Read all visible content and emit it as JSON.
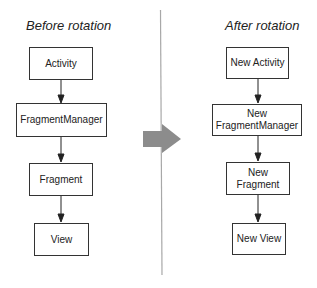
{
  "diagram": {
    "left_panel": {
      "title": "Before rotation",
      "nodes": [
        {
          "id": "activity",
          "label": "Activity"
        },
        {
          "id": "fragment-manager",
          "label": "FragmentManager"
        },
        {
          "id": "fragment",
          "label": "Fragment"
        },
        {
          "id": "view",
          "label": "View"
        }
      ]
    },
    "right_panel": {
      "title": "After rotation",
      "nodes": [
        {
          "id": "new-activity",
          "label": "New Activity"
        },
        {
          "id": "new-fragment-manager",
          "label": "New\nFragmentManager"
        },
        {
          "id": "new-fragment",
          "label": "New\nFragment"
        },
        {
          "id": "new-view",
          "label": "New View"
        }
      ]
    },
    "edges": [
      {
        "from": "activity",
        "to": "fragment-manager"
      },
      {
        "from": "fragment-manager",
        "to": "fragment"
      },
      {
        "from": "fragment",
        "to": "view"
      },
      {
        "from": "new-activity",
        "to": "new-fragment-manager"
      },
      {
        "from": "new-fragment-manager",
        "to": "new-fragment"
      },
      {
        "from": "new-fragment",
        "to": "new-view"
      }
    ],
    "transition_arrow": {
      "direction": "right",
      "color": "#8c8c8c"
    },
    "divider_color": "#a8a8a8"
  }
}
